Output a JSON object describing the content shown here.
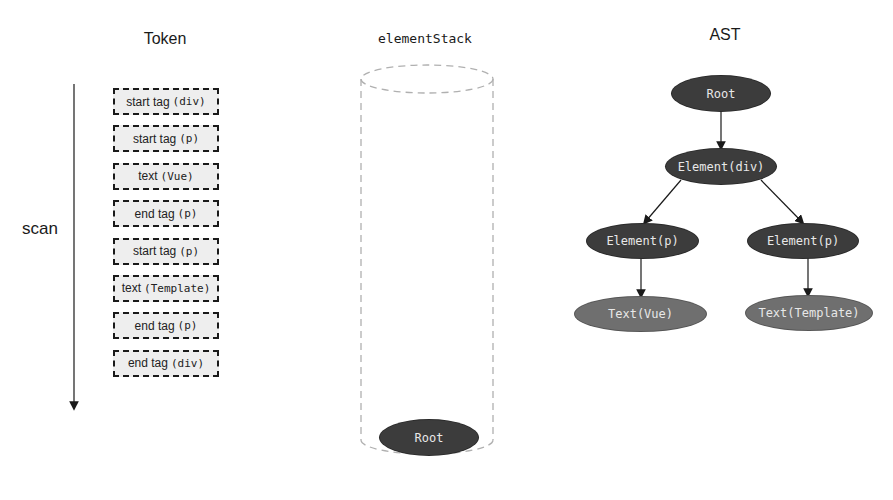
{
  "headings": {
    "token": "Token",
    "element_stack": "elementStack",
    "ast": "AST"
  },
  "scan": {
    "label": "scan",
    "direction": "down"
  },
  "tokens": [
    {
      "label": "start tag",
      "arg": "(div)"
    },
    {
      "label": "start tag",
      "arg": "(p)"
    },
    {
      "label": "text",
      "arg": "(Vue)"
    },
    {
      "label": "end tag",
      "arg": "(p)"
    },
    {
      "label": "start tag",
      "arg": "(p)"
    },
    {
      "label": "text",
      "arg": "(Template)"
    },
    {
      "label": "end tag",
      "arg": "(p)"
    },
    {
      "label": "end tag",
      "arg": "(div)"
    }
  ],
  "element_stack": {
    "items": [
      {
        "label": "Root"
      }
    ]
  },
  "ast": {
    "nodes": [
      {
        "id": "root",
        "label": "Root"
      },
      {
        "id": "div",
        "label": "Element(div)"
      },
      {
        "id": "p1",
        "label": "Element(p)"
      },
      {
        "id": "p2",
        "label": "Element(p)"
      },
      {
        "id": "t1",
        "label": "Text(Vue)"
      },
      {
        "id": "t2",
        "label": "Text(Template)"
      }
    ],
    "edges": [
      [
        "root",
        "div"
      ],
      [
        "div",
        "p1"
      ],
      [
        "div",
        "p2"
      ],
      [
        "p1",
        "t1"
      ],
      [
        "p2",
        "t2"
      ]
    ]
  },
  "colors": {
    "element_node": "#3c3c3c",
    "text_node": "#6f6f6f",
    "node_text": "#e8e8e8",
    "token_fill": "#eeeeee",
    "token_border": "#1a1a1a",
    "stack_outline": "#b0b0b0"
  }
}
